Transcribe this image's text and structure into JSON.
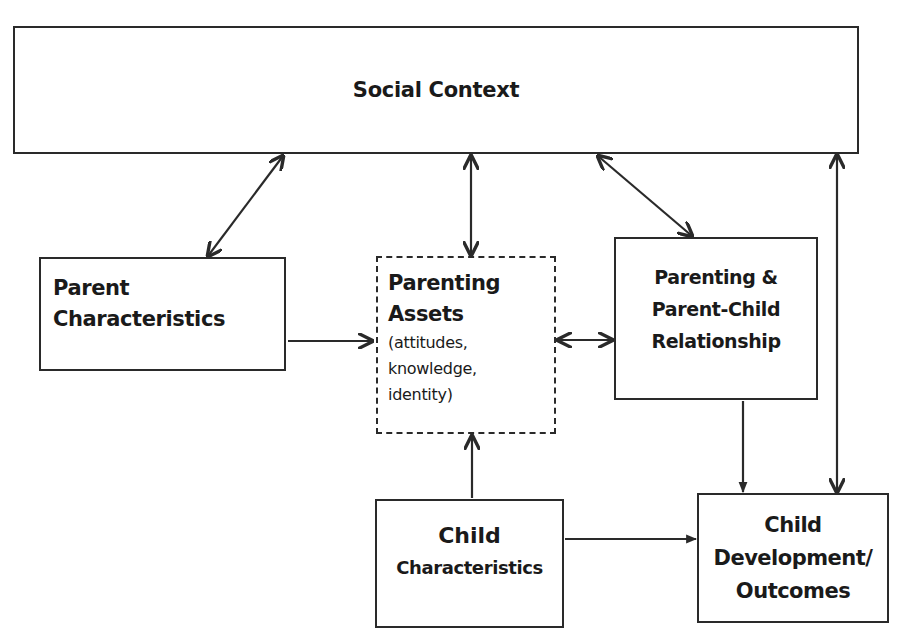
{
  "diagram": {
    "nodes": {
      "social_context": {
        "label": "Social Context"
      },
      "parent_characteristics": {
        "line1": "Parent",
        "line2": "Characteristics"
      },
      "parenting_assets": {
        "title_line1": "Parenting",
        "title_line2": "Assets",
        "detail_line1": "(attitudes,",
        "detail_line2": "knowledge,",
        "detail_line3": "identity)"
      },
      "parenting_relationship": {
        "line1": "Parenting &",
        "line2": "Parent-Child",
        "line3": "Relationship"
      },
      "child_characteristics": {
        "line1": "Child",
        "line2": "Characteristics"
      },
      "child_outcomes": {
        "line1": "Child",
        "line2": "Development/",
        "line3": "Outcomes"
      }
    },
    "edges": [
      {
        "from": "social_context",
        "to": "parent_characteristics",
        "direction": "both"
      },
      {
        "from": "social_context",
        "to": "parenting_assets",
        "direction": "both"
      },
      {
        "from": "social_context",
        "to": "parenting_relationship",
        "direction": "both"
      },
      {
        "from": "social_context",
        "to": "child_outcomes",
        "direction": "both"
      },
      {
        "from": "parent_characteristics",
        "to": "parenting_assets",
        "direction": "forward"
      },
      {
        "from": "parenting_assets",
        "to": "parenting_relationship",
        "direction": "both"
      },
      {
        "from": "child_characteristics",
        "to": "parenting_assets",
        "direction": "forward"
      },
      {
        "from": "parenting_relationship",
        "to": "child_outcomes",
        "direction": "forward"
      },
      {
        "from": "child_characteristics",
        "to": "child_outcomes",
        "direction": "forward"
      }
    ],
    "colors": {
      "stroke": "#2a2a2a",
      "background": "#ffffff"
    }
  }
}
